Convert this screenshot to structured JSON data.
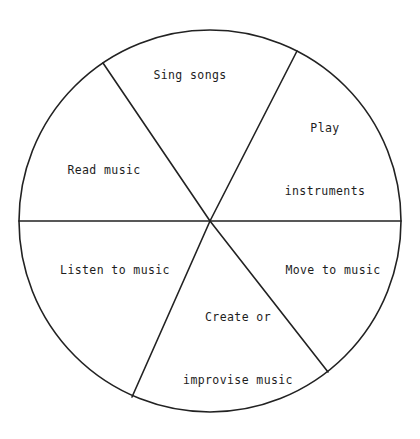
{
  "diagram": {
    "type": "pie-wheel",
    "background_color": "#ffffff",
    "stroke_color": "#222222",
    "text_color": "#1d1d1d",
    "center": {
      "x": 210,
      "y": 221
    },
    "radius": 191,
    "sector_count": 6,
    "sectors": [
      {
        "id": "sing-songs",
        "label": "Sing songs",
        "lines": [
          "Sing songs"
        ],
        "start_angle_deg": 63,
        "end_angle_deg": 124
      },
      {
        "id": "play-instruments",
        "label": "Play instruments",
        "lines": [
          "Play",
          "instruments"
        ],
        "start_angle_deg": 0,
        "end_angle_deg": 63
      },
      {
        "id": "move-to-music",
        "label": "Move to music",
        "lines": [
          "Move to music"
        ],
        "start_angle_deg": -52,
        "end_angle_deg": 0
      },
      {
        "id": "create-or-improvise-music",
        "label": "Create or improvise music",
        "lines": [
          "Create or",
          "improvise music"
        ],
        "start_angle_deg": -113,
        "end_angle_deg": -52
      },
      {
        "id": "listen-to-music",
        "label": "Listen to music",
        "lines": [
          "Listen to music"
        ],
        "start_angle_deg": -180,
        "end_angle_deg": -113
      },
      {
        "id": "read-music",
        "label": "Read music",
        "lines": [
          "Read music"
        ],
        "start_angle_deg": 124,
        "end_angle_deg": 180
      }
    ]
  }
}
